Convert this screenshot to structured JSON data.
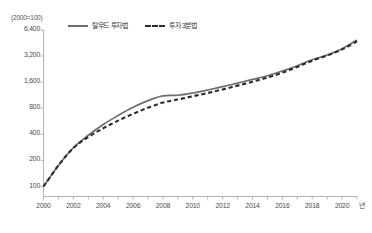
{
  "chart_data": {
    "type": "line",
    "title": "",
    "unit_note": "(2000=100)",
    "xlabel": "년",
    "ylabel": "",
    "yscale": "log",
    "ylim": [
      85,
      7200
    ],
    "xlim": [
      2000,
      2021
    ],
    "grid": false,
    "legend_position": "top-center",
    "ytick_labels": [
      "6,400",
      "3,200",
      "1,600",
      "800",
      "400",
      "200",
      "100"
    ],
    "ytick_values": [
      6400,
      3200,
      1600,
      800,
      400,
      200,
      100
    ],
    "xtick_labels": [
      "2000",
      "2002",
      "2004",
      "2006",
      "2008",
      "2010",
      "2012",
      "2014",
      "2016",
      "2018",
      "2020"
    ],
    "xtick_values": [
      2000,
      2002,
      2004,
      2006,
      2008,
      2010,
      2012,
      2014,
      2016,
      2018,
      2020
    ],
    "x": [
      2000,
      2001,
      2002,
      2003,
      2004,
      2005,
      2006,
      2007,
      2008,
      2009,
      2010,
      2011,
      2012,
      2013,
      2014,
      2015,
      2016,
      2017,
      2018,
      2019,
      2020,
      2021
    ],
    "series": [
      {
        "name": "탈무드 투자법",
        "style": "solid",
        "color": "#6e6e6e",
        "values": [
          100,
          175,
          280,
          390,
          520,
          660,
          820,
          980,
          1110,
          1130,
          1200,
          1300,
          1420,
          1560,
          1720,
          1900,
          2150,
          2480,
          2900,
          3300,
          3900,
          4900
        ]
      },
      {
        "name": "투자 3분법",
        "style": "dashed",
        "color": "#2b2b2b",
        "values": [
          100,
          175,
          278,
          372,
          470,
          575,
          690,
          810,
          930,
          1010,
          1100,
          1200,
          1320,
          1460,
          1620,
          1810,
          2060,
          2400,
          2830,
          3250,
          3820,
          4750
        ]
      }
    ]
  },
  "axis": {
    "unit_note": "(2000=100)",
    "x_unit": "년"
  }
}
